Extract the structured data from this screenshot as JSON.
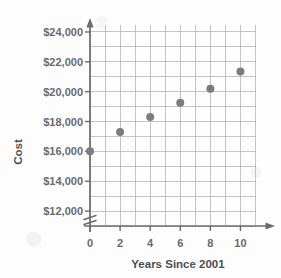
{
  "chart_data": {
    "type": "scatter",
    "title": "",
    "xlabel": "Years Since 2001",
    "ylabel": "Cost",
    "x": [
      0,
      2,
      4,
      6,
      8,
      10
    ],
    "values": [
      16000,
      17300,
      18300,
      19250,
      20200,
      21350
    ],
    "points": [
      {
        "x": 0,
        "y": 16000
      },
      {
        "x": 2,
        "y": 17300
      },
      {
        "x": 4,
        "y": 18300
      },
      {
        "x": 6,
        "y": 19250
      },
      {
        "x": 8,
        "y": 20200
      },
      {
        "x": 10,
        "y": 21350
      }
    ],
    "xlim": [
      0,
      11
    ],
    "ylim": [
      11000,
      24500
    ],
    "xticks": [
      0,
      2,
      4,
      6,
      8,
      10
    ],
    "xtick_labels": [
      "0",
      "2",
      "4",
      "6",
      "8",
      "10"
    ],
    "yticks": [
      12000,
      14000,
      16000,
      18000,
      20000,
      22000,
      24000
    ],
    "ytick_labels": [
      "$12,000",
      "$14,000",
      "$16,000",
      "$18,000",
      "$20,000",
      "$22,000",
      "$24,000"
    ],
    "grid": true,
    "grid_x_step": 1,
    "grid_y_step": 1000,
    "legend": null,
    "axis_break": {
      "axis": "y",
      "symbol": "zigzag",
      "below_value": 12000
    },
    "marker": {
      "shape": "circle",
      "color": "#7b7b80",
      "radius": 4
    },
    "colors": {
      "grid": "#a9a9b0",
      "axis": "#6b6b70",
      "marker": "#7b7b80",
      "label_text": "#6a6a6e",
      "title_text": "#4e4e52",
      "background": "#fdfdfd"
    }
  },
  "axis_labels": {
    "y_title": "Cost",
    "x_title": "Years Since 2001"
  }
}
